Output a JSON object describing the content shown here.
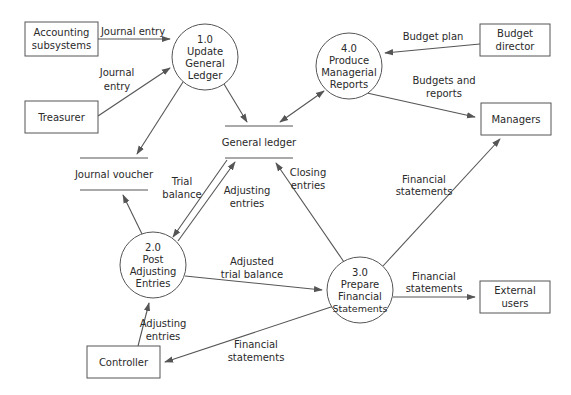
{
  "diagram": {
    "type": "data-flow-diagram",
    "external_entities": [
      {
        "id": "accounting",
        "lines": [
          "Accounting",
          "subsystems"
        ]
      },
      {
        "id": "treasurer",
        "lines": [
          "Treasurer"
        ]
      },
      {
        "id": "budget-director",
        "lines": [
          "Budget",
          "director"
        ]
      },
      {
        "id": "managers",
        "lines": [
          "Managers"
        ]
      },
      {
        "id": "external-users",
        "lines": [
          "External",
          "users"
        ]
      },
      {
        "id": "controller",
        "lines": [
          "Controller"
        ]
      }
    ],
    "processes": [
      {
        "id": "p1",
        "number": "1.0",
        "lines": [
          "Update",
          "General",
          "Ledger"
        ]
      },
      {
        "id": "p2",
        "number": "2.0",
        "lines": [
          "Post",
          "Adjusting",
          "Entries"
        ]
      },
      {
        "id": "p3",
        "number": "3.0",
        "lines": [
          "Prepare",
          "Financial",
          "Statements"
        ]
      },
      {
        "id": "p4",
        "number": "4.0",
        "lines": [
          "Produce",
          "Managerial",
          "Reports"
        ]
      }
    ],
    "data_stores": [
      {
        "id": "general-ledger",
        "label": "General ledger"
      },
      {
        "id": "journal-voucher",
        "label": "Journal voucher"
      }
    ],
    "flows": [
      {
        "from": "accounting",
        "to": "p1",
        "lines": [
          "Journal entry"
        ]
      },
      {
        "from": "treasurer",
        "to": "p1",
        "lines": [
          "Journal",
          "entry"
        ]
      },
      {
        "from": "p1",
        "to": "general-ledger",
        "lines": []
      },
      {
        "from": "p1",
        "to": "journal-voucher",
        "lines": []
      },
      {
        "from": "budget-director",
        "to": "p4",
        "lines": [
          "Budget plan"
        ]
      },
      {
        "from": "p4",
        "to": "managers",
        "lines": [
          "Budgets and",
          "reports"
        ]
      },
      {
        "from": "general-ledger",
        "to": "p4",
        "lines": [],
        "bidirectional": true
      },
      {
        "from": "general-ledger",
        "to": "p2",
        "lines": [
          "Trial",
          "balance"
        ]
      },
      {
        "from": "p2",
        "to": "general-ledger",
        "lines": [
          "Adjusting",
          "entries"
        ]
      },
      {
        "from": "p2",
        "to": "journal-voucher",
        "lines": []
      },
      {
        "from": "p3",
        "to": "general-ledger",
        "lines": [
          "Closing",
          "entries"
        ]
      },
      {
        "from": "p3",
        "to": "managers",
        "lines": [
          "Financial",
          "statements"
        ]
      },
      {
        "from": "p2",
        "to": "p3",
        "lines": [
          "Adjusted",
          "trial balance"
        ]
      },
      {
        "from": "p3",
        "to": "external-users",
        "lines": [
          "Financial",
          "statements"
        ]
      },
      {
        "from": "controller",
        "to": "p2",
        "lines": [
          "Adjusting",
          "entries"
        ]
      },
      {
        "from": "p3",
        "to": "controller",
        "lines": [
          "Financial",
          "statements"
        ]
      }
    ]
  },
  "colors": {
    "stroke": "#555555",
    "text": "#2a2a2a",
    "background": "#ffffff"
  }
}
